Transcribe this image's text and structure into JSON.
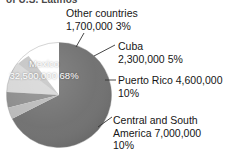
{
  "figure": {
    "title_fragment": "of U.S. Latinos",
    "background": "#ffffff"
  },
  "chart_data": {
    "type": "pie",
    "title": "of U.S. Latinos",
    "xlabel": "",
    "ylabel": "",
    "legend_position": "callout-labels",
    "grid": false,
    "total": 48100000,
    "categories": [
      "Mexico",
      "Other countries",
      "Cuba",
      "Puerto Rico",
      "Central and South America"
    ],
    "values": [
      32500000,
      1700000,
      2300000,
      4600000,
      7000000
    ],
    "percents": [
      68,
      3,
      5,
      10,
      10
    ],
    "colors": [
      "#6f6f6f",
      "#b9b9b9",
      "#8a8a8a",
      "#d6d6d6",
      "#c4c4c4"
    ],
    "slices": [
      {
        "name": "Mexico",
        "value": 32500000,
        "value_text": "32,500,000",
        "percent": 68,
        "percent_text": "68%",
        "color": "#6f6f6f",
        "label_placement": "inside"
      },
      {
        "name": "Other countries",
        "value": 1700000,
        "value_text": "1,700,000",
        "percent": 3,
        "percent_text": "3%",
        "color": "#b9b9b9",
        "label_placement": "callout"
      },
      {
        "name": "Cuba",
        "value": 2300000,
        "value_text": "2,300,000",
        "percent": 5,
        "percent_text": "5%",
        "color": "#8a8a8a",
        "label_placement": "callout"
      },
      {
        "name": "Puerto Rico",
        "value": 4600000,
        "value_text": "4,600,000",
        "percent": 10,
        "percent_text": "10%",
        "color": "#d6d6d6",
        "label_placement": "callout"
      },
      {
        "name": "Central and South America",
        "value": 7000000,
        "value_text": "7,000,000",
        "percent": 10,
        "percent_text": "10%",
        "color": "#c4c4c4",
        "label_placement": "callout"
      }
    ]
  },
  "labels": {
    "mexico_inside": "Mexico\n32,500,000\n68%",
    "other_countries": "Other countries\n1,700,000  3%",
    "cuba": "Cuba\n2,300,000  5%",
    "puerto_rico": "Puerto Rico  4,600,000\n10%",
    "central_south_america": "Central and South\nAmerica  7,000,000\n10%"
  }
}
